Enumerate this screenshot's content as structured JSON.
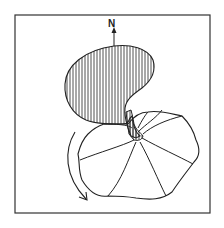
{
  "figure": {
    "north_label": "N",
    "colors": {
      "ink": "#222222",
      "background": "#ffffff"
    },
    "elements": [
      {
        "name": "frame",
        "type": "rectangle"
      },
      {
        "name": "north-arrow",
        "type": "arrow",
        "direction": "up"
      },
      {
        "name": "hatched-lobe",
        "type": "hatched-region",
        "hatch": "vertical"
      },
      {
        "name": "scalloped-fan",
        "type": "outlined-region",
        "radial_segments": 7
      },
      {
        "name": "curved-arrow",
        "type": "arrow",
        "direction": "clockwise-down"
      }
    ]
  }
}
